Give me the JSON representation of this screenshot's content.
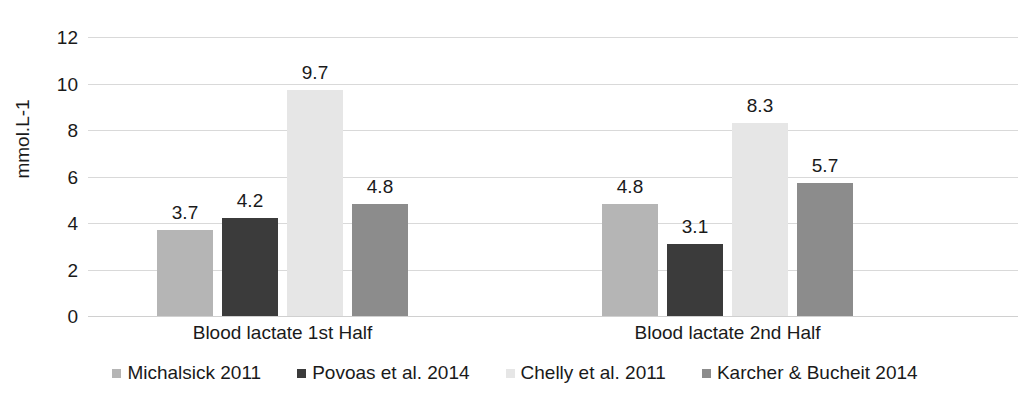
{
  "chart_data": {
    "type": "bar",
    "title": "",
    "subtitle": "",
    "xlabel": "",
    "ylabel": "mmol.L-1",
    "ylim": [
      0,
      12
    ],
    "ytick_step": 2,
    "yticks": [
      "0",
      "2",
      "4",
      "6",
      "8",
      "10",
      "12"
    ],
    "grid": true,
    "legend_position": "bottom",
    "categories": [
      "Blood lactate 1st Half",
      "Blood lactate 2nd Half"
    ],
    "series": [
      {
        "name": "Michalsick 2011",
        "color": "#b5b5b5",
        "values": [
          3.7,
          4.8
        ],
        "labels": [
          "3.7",
          "4.8"
        ]
      },
      {
        "name": "Povoas et al. 2014",
        "color": "#3b3b3b",
        "values": [
          4.2,
          3.1
        ],
        "labels": [
          "4.2",
          "3.1"
        ]
      },
      {
        "name": "Chelly et al. 2011",
        "color": "#e6e6e6",
        "values": [
          9.7,
          8.3
        ],
        "labels": [
          "9.7",
          "8.3"
        ]
      },
      {
        "name": "Karcher & Bucheit 2014",
        "color": "#8c8c8c",
        "values": [
          4.8,
          5.7
        ],
        "labels": [
          "4.8",
          "5.7"
        ]
      }
    ]
  },
  "axis": {
    "y_title": "mmol.L-1",
    "ticks": [
      {
        "value": 12,
        "label": "12"
      },
      {
        "value": 10,
        "label": "10"
      },
      {
        "value": 8,
        "label": "8"
      },
      {
        "value": 6,
        "label": "6"
      },
      {
        "value": 4,
        "label": "4"
      },
      {
        "value": 2,
        "label": "2"
      },
      {
        "value": 0,
        "label": "0"
      }
    ]
  },
  "categories": [
    {
      "label": "Blood lactate 1st Half"
    },
    {
      "label": "Blood lactate 2nd Half"
    }
  ],
  "legend": {
    "items": [
      {
        "label": "Michalsick 2011",
        "color": "#b5b5b5"
      },
      {
        "label": "Povoas et al. 2014",
        "color": "#3b3b3b"
      },
      {
        "label": "Chelly et al. 2011",
        "color": "#e6e6e6"
      },
      {
        "label": "Karcher & Bucheit 2014",
        "color": "#8c8c8c"
      }
    ]
  },
  "colors": {
    "gridline": "#d9d9d9",
    "text": "#1a1a1a",
    "background": "#ffffff"
  }
}
